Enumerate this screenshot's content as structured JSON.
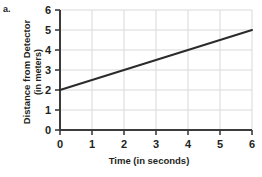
{
  "problem": {
    "label": "a."
  },
  "chart_data": {
    "type": "line",
    "title": "",
    "subtitle": "",
    "xlabel": "Time (in seconds)",
    "ylabel": "Distance from Detector (in meters)",
    "ylabel_line1": "Distance from Detector",
    "ylabel_line2": "(in meters)",
    "xlim": [
      0,
      6
    ],
    "ylim": [
      0,
      6
    ],
    "xticks": [
      0,
      1,
      2,
      3,
      4,
      5,
      6
    ],
    "yticks": [
      0,
      1,
      2,
      3,
      4,
      5,
      6
    ],
    "xtick_labels": [
      "0",
      "1",
      "2",
      "3",
      "4",
      "5",
      "6"
    ],
    "ytick_labels": [
      "0",
      "1",
      "2",
      "3",
      "4",
      "5",
      "6"
    ],
    "grid": true,
    "grid_color": "#d9d9d9",
    "axis_color": "#3b3b3b",
    "legend": false,
    "legend_position": "none",
    "series": [
      {
        "name": "Distance from Detector",
        "color": "#2b2b2b",
        "x": [
          0,
          1,
          2,
          3,
          4,
          5,
          6
        ],
        "y": [
          2,
          2.5,
          3,
          3.5,
          4,
          4.5,
          5
        ],
        "slope": 0.5,
        "intercept": 2
      }
    ]
  }
}
